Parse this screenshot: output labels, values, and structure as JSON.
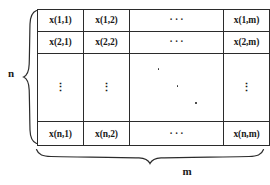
{
  "figure": {
    "type": "matrix-diagram",
    "row_label": "n",
    "col_label": "m",
    "columns": 4,
    "rows": 4,
    "matrix": {
      "row1": {
        "c1": "x(1,1)",
        "c2": "x(1,2)",
        "c3": "· · ·",
        "c4": "x(1,m)"
      },
      "row2": {
        "c1": "x(2,1)",
        "c2": "x(2,2)",
        "c3": "· · ·",
        "c4": "x(2,m)"
      },
      "row3": {
        "c1": "⋮",
        "c2": "⋮",
        "c3": "⋱",
        "c4": "⋮"
      },
      "row4": {
        "c1": "x(n,1)",
        "c2": "x(n,2)",
        "c3": "· · ·",
        "c4": "x(n,m)"
      }
    },
    "colors": {
      "ink": "#2b2b2b",
      "background": "#ffffff"
    }
  }
}
